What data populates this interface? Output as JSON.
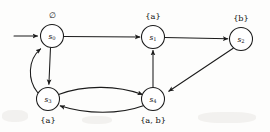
{
  "diagram": {
    "kind": "state-transition-diagram",
    "width": 270,
    "height": 132,
    "stroke_color": "#1b1b1b",
    "node_fill": "#ffffff",
    "background": "#fdfdfc",
    "node_radius": 11.5,
    "start_marker": {
      "name": "initial-state-arrow",
      "target_state": "s0",
      "from_x": 14,
      "to_x": 38,
      "y": 36
    },
    "states": [
      {
        "id": "s0",
        "name": "s",
        "subscript": "0",
        "cx": 52,
        "cy": 36,
        "label_text": "∅",
        "label_plain": "empty set",
        "label_position": "above",
        "label_x": 52,
        "label_y": 18
      },
      {
        "id": "s1",
        "name": "s",
        "subscript": "1",
        "cx": 153,
        "cy": 37,
        "label_text": "{a}",
        "label_plain": "a",
        "label_position": "above",
        "label_x": 153,
        "label_y": 19
      },
      {
        "id": "s2",
        "name": "s",
        "subscript": "2",
        "cx": 241,
        "cy": 39,
        "label_text": "{b}",
        "label_plain": "b",
        "label_position": "above",
        "label_x": 241,
        "label_y": 21
      },
      {
        "id": "s3",
        "name": "s",
        "subscript": "3",
        "cx": 48,
        "cy": 99,
        "label_text": "{a}",
        "label_plain": "a",
        "label_position": "below",
        "label_x": 48,
        "label_y": 123
      },
      {
        "id": "s4",
        "name": "s",
        "subscript": "4",
        "cx": 153,
        "cy": 99,
        "label_text": "{a, b}",
        "label_plain": "a, b",
        "label_position": "below",
        "label_x": 153,
        "label_y": 123
      }
    ],
    "transitions": [
      {
        "id": "t0",
        "from": "s0",
        "to": "s1",
        "shape": "straight-horizontal"
      },
      {
        "id": "t1",
        "from": "s1",
        "to": "s2",
        "shape": "straight-horizontal"
      },
      {
        "id": "t2",
        "from": "s0",
        "to": "s3",
        "shape": "straight-vertical-down"
      },
      {
        "id": "t3",
        "from": "s3",
        "to": "s0",
        "shape": "curve-left-up"
      },
      {
        "id": "t4",
        "from": "s3",
        "to": "s4",
        "shape": "curve-upper-right"
      },
      {
        "id": "t5",
        "from": "s4",
        "to": "s3",
        "shape": "curve-lower-left"
      },
      {
        "id": "t6",
        "from": "s4",
        "to": "s1",
        "shape": "straight-vertical-up"
      },
      {
        "id": "t7",
        "from": "s2",
        "to": "s4",
        "shape": "diagonal-down-left"
      }
    ]
  }
}
